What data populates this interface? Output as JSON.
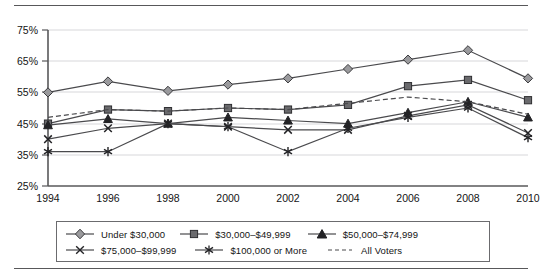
{
  "chart_data": {
    "type": "line",
    "title": "",
    "subtitle": "",
    "xlabel": "",
    "ylabel": "",
    "categories": [
      "1994",
      "1996",
      "1998",
      "2000",
      "2002",
      "2004",
      "2006",
      "2008",
      "2010"
    ],
    "x": [
      1994,
      1996,
      1998,
      2000,
      2002,
      2004,
      2006,
      2008,
      2010
    ],
    "ylim": [
      25,
      75
    ],
    "yticks": [
      25,
      35,
      45,
      55,
      65,
      75
    ],
    "ytick_labels": [
      "25%",
      "35%",
      "45%",
      "55%",
      "65%",
      "75%"
    ],
    "xtick_labels": [
      "1994",
      "1996",
      "1998",
      "2000",
      "2002",
      "2004",
      "2006",
      "2008",
      "2010"
    ],
    "grid": "horizontal",
    "legend_position": "bottom",
    "series": [
      {
        "name": "Under $30,000",
        "marker": "diamond",
        "style": "solid",
        "values": [
          55.0,
          58.5,
          55.5,
          57.5,
          59.5,
          62.5,
          65.5,
          68.5,
          59.5
        ]
      },
      {
        "name": "$30,000–$49,999",
        "marker": "square",
        "style": "solid",
        "values": [
          45.0,
          49.5,
          49.0,
          50.0,
          49.5,
          51.0,
          57.0,
          59.0,
          52.5
        ]
      },
      {
        "name": "$50,000–$74,999",
        "marker": "triangle",
        "style": "solid",
        "values": [
          44.5,
          46.5,
          45.0,
          47.0,
          46.0,
          45.0,
          48.5,
          52.0,
          47.0
        ]
      },
      {
        "name": "$75,000–$99,999",
        "marker": "x",
        "style": "solid",
        "values": [
          40.0,
          43.5,
          45.0,
          44.0,
          43.0,
          43.0,
          47.5,
          51.0,
          42.0
        ]
      },
      {
        "name": "$100,000 or More",
        "marker": "asterisk",
        "style": "solid",
        "values": [
          36.0,
          36.0,
          45.0,
          44.0,
          36.0,
          43.5,
          47.0,
          50.0,
          40.5
        ]
      },
      {
        "name": "All Voters",
        "marker": "none",
        "style": "dashed",
        "values": [
          47.0,
          49.5,
          49.0,
          50.0,
          49.5,
          51.5,
          53.5,
          52.0,
          48.0
        ]
      }
    ]
  },
  "legend": {
    "items": [
      {
        "label": "Under $30,000",
        "marker": "diamond-marker-icon"
      },
      {
        "label": "$30,000–$49,999",
        "marker": "square-marker-icon"
      },
      {
        "label": "$50,000–$74,999",
        "marker": "triangle-marker-icon"
      },
      {
        "label": "$75,000–$99,999",
        "marker": "x-marker-icon"
      },
      {
        "label": "$100,000 or More",
        "marker": "asterisk-marker-icon"
      },
      {
        "label": "All Voters",
        "marker": "dashed-line-icon"
      }
    ]
  },
  "colors": {
    "line": "#4a4a4d",
    "marker_fill_light": "#9a9a9d",
    "marker_fill_dark": "#3a3a3d",
    "grid": "#d7d7da",
    "axis": "#58585a",
    "text": "#141414",
    "rule": "#58585a"
  }
}
